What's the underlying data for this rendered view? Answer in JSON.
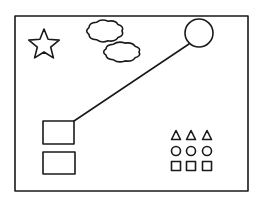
{
  "diagram": {
    "colors": {
      "ink": "#1a1a1a",
      "background": "#ffffff"
    },
    "frame": {
      "x": 15,
      "y": 16,
      "width": 233,
      "height": 175
    },
    "star": {
      "cx": 44,
      "cy": 45,
      "r_outer": 16,
      "r_inner": 7
    },
    "clouds": [
      {
        "cx": 105,
        "cy": 31,
        "rx": 17,
        "ry": 10
      },
      {
        "cx": 122,
        "cy": 52,
        "rx": 17,
        "ry": 9
      }
    ],
    "circle": {
      "cx": 199,
      "cy": 33,
      "r": 14
    },
    "connector_line": {
      "x1": 189,
      "y1": 44,
      "x2": 74,
      "y2": 121
    },
    "rectangles": [
      {
        "x": 43,
        "y": 121,
        "width": 31,
        "height": 23
      },
      {
        "x": 43,
        "y": 152,
        "width": 32,
        "height": 22
      }
    ],
    "shape_grid": {
      "columns_x": [
        176,
        191,
        207
      ],
      "rows": [
        {
          "shape": "triangle",
          "y": 135
        },
        {
          "shape": "circle",
          "y": 151
        },
        {
          "shape": "square",
          "y": 166
        }
      ],
      "size": 9
    }
  }
}
